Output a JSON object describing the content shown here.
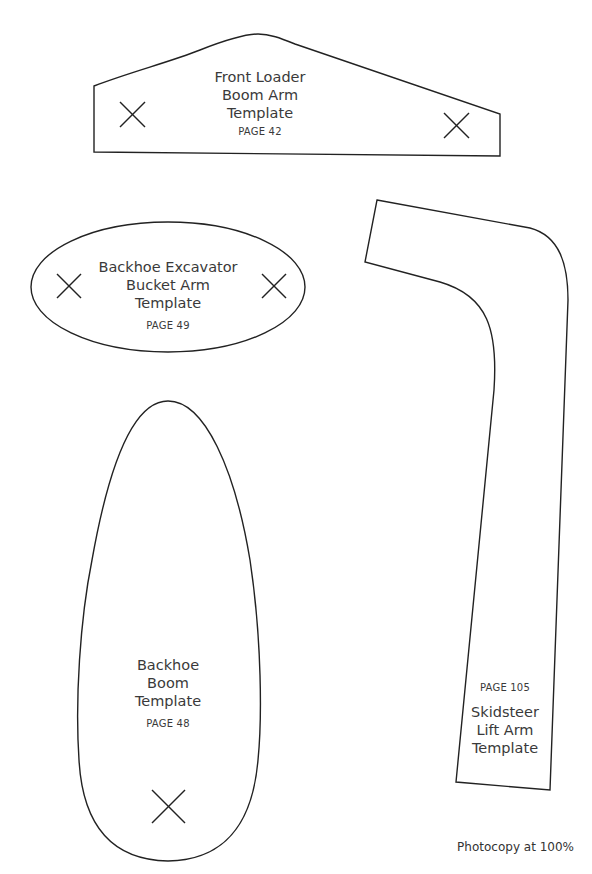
{
  "templates": [
    {
      "id": "front-loader",
      "title_lines": [
        "Front Loader",
        "Boom Arm",
        "Template"
      ],
      "page": "PAGE 42",
      "markers": 2
    },
    {
      "id": "backhoe-excavator",
      "title_lines": [
        "Backhoe Excavator",
        "Bucket Arm",
        "Template"
      ],
      "page": "PAGE 49",
      "markers": 2
    },
    {
      "id": "backhoe-boom",
      "title_lines": [
        "Backhoe",
        "Boom",
        "Template"
      ],
      "page": "PAGE 48",
      "markers": 1
    },
    {
      "id": "skidsteer",
      "title_lines": [
        "Skidsteer",
        "Lift Arm",
        "Template"
      ],
      "page": "PAGE 105",
      "markers": 0
    }
  ],
  "footer": {
    "note": "Photocopy at 100%"
  },
  "colors": {
    "outline": "#222222",
    "text": "#3a3a3a",
    "background": "#ffffff"
  }
}
